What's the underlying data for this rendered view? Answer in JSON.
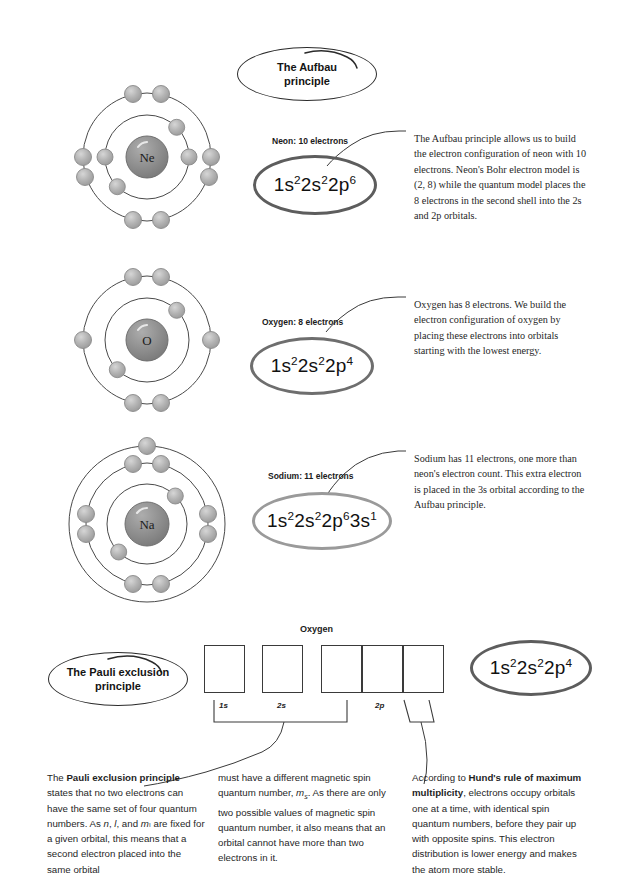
{
  "page": {
    "width": 628,
    "height": 894,
    "background": "#ffffff"
  },
  "colors": {
    "ink": "#1b1b1b",
    "bubble_stroke": "#2b2b2b",
    "cfg_dark": "#5d5d5d",
    "cfg_mid": "#6e6e6e",
    "cfg_light": "#9a9a9a",
    "electron_fill": "#b0b0b0",
    "nucleus_fill": "#8e8e8e",
    "shell_stroke": "#4a4a4a",
    "arrow_gray": "#8a8a8a"
  },
  "bubbles": {
    "aufbau_title": "The Aufbau\nprinciple",
    "aufbau_title_line1": "The Aufbau",
    "aufbau_title_line2": "principle",
    "pauli_title_line1": "The Pauli exclusion",
    "pauli_title_line2": "principle"
  },
  "sections": [
    {
      "id": "neon",
      "element_symbol": "Ne",
      "caption": "Neon: 10 electrons",
      "configuration": [
        {
          "shell": "1s",
          "count": "2"
        },
        {
          "shell": "2s",
          "count": "2"
        },
        {
          "shell": "2p",
          "count": "6"
        }
      ],
      "configuration_plain": "1s2 2s2 2p6",
      "shells": [
        2,
        8
      ],
      "bohr_model": "2, 8",
      "bubble_style": "dark",
      "paragraph": "The Aufbau principle allows us to build the electron configuration of neon with 10 electrons. Neon's Bohr electron model is (2, 8) while the quantum model places the 8 electrons in the second shell into the 2s and 2p orbitals."
    },
    {
      "id": "oxygen",
      "element_symbol": "O",
      "caption": "Oxygen: 8 electrons",
      "configuration": [
        {
          "shell": "1s",
          "count": "2"
        },
        {
          "shell": "2s",
          "count": "2"
        },
        {
          "shell": "2p",
          "count": "4"
        }
      ],
      "configuration_plain": "1s2 2s2 2p4",
      "shells": [
        2,
        6
      ],
      "bohr_model": "2, 6",
      "bubble_style": "mid",
      "paragraph": "Oxygen has 8 electrons. We build the electron configuration of oxygen by placing these electrons into orbitals starting with the lowest energy."
    },
    {
      "id": "sodium",
      "element_symbol": "Na",
      "caption": "Sodium: 11 electrons",
      "configuration": [
        {
          "shell": "1s",
          "count": "2"
        },
        {
          "shell": "2s",
          "count": "2"
        },
        {
          "shell": "2p",
          "count": "6"
        },
        {
          "shell": "3s",
          "count": "1"
        }
      ],
      "configuration_plain": "1s2 2s2 2p6 3s1",
      "shells": [
        2,
        8,
        1
      ],
      "bohr_model": "2, 8, 1",
      "bubble_style": "light",
      "paragraph": "Sodium has 11 electrons, one more than neon's electron count. This extra electron is placed in the 3s orbital according to the Aufbau principle."
    }
  ],
  "orbital_diagram": {
    "title": "Oxygen",
    "subshell_labels": [
      "1s",
      "2s",
      "2p"
    ],
    "boxes": [
      {
        "subshell": "1s",
        "arrows": [
          "up",
          "down"
        ]
      },
      {
        "subshell": "2s",
        "arrows": [
          "up",
          "down"
        ]
      },
      {
        "subshell": "2p",
        "arrows": [
          "up",
          "down"
        ]
      },
      {
        "subshell": "2p",
        "arrows": [
          "up"
        ]
      },
      {
        "subshell": "2p",
        "arrows": [
          "up"
        ]
      }
    ],
    "result_configuration": [
      {
        "shell": "1s",
        "count": "2"
      },
      {
        "shell": "2s",
        "count": "2"
      },
      {
        "shell": "2p",
        "count": "4"
      }
    ],
    "result_configuration_plain": "1s2 2s2 2p4"
  },
  "footer_columns": [
    {
      "id": "pauli",
      "lead_bold": "Pauli exclusion principle",
      "text_before": "The ",
      "text_after": " states that no two electrons can have the same set of four quantum numbers. As n, l, and mₗ are fixed for a given orbital, this means that a second electron placed into the same orbital"
    },
    {
      "id": "pauli-cont",
      "lead_bold": "",
      "text_before": "",
      "text_after": "must have a different magnetic spin quantum number, mₛ. As there are only two possible values of magnetic spin quantum number, it also means that an orbital cannot have more than two electrons in it."
    },
    {
      "id": "hund",
      "lead_bold": "Hund's rule of maximum multiplicity",
      "text_before": "According to ",
      "text_after": ", electrons occupy orbitals one at a time, with identical spin quantum numbers, before they pair up with opposite spins. This electron distribution is lower energy and makes the atom more stable."
    }
  ]
}
